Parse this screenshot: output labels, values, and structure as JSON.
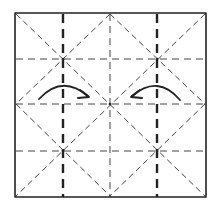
{
  "diagram": {
    "title": "Origami folding step: square base crease pattern with inward folds",
    "colors": {
      "ink": "#222222",
      "paper": "#ffffff",
      "line_light": "#444444"
    },
    "paper_square": {
      "x1": 15,
      "y1": 13,
      "x2": 206,
      "y2": 197
    },
    "valley_folds_thick": [
      {
        "x1": 63,
        "y1": 14,
        "x2": 63,
        "y2": 197
      },
      {
        "x1": 157,
        "y1": 14,
        "x2": 157,
        "y2": 197
      }
    ],
    "creases_vertical_thin": [
      {
        "x1": 110,
        "y1": 14,
        "x2": 110,
        "y2": 197
      }
    ],
    "creases_horizontal_thin": [
      {
        "x1": 16,
        "y1": 59,
        "x2": 205,
        "y2": 59
      },
      {
        "x1": 16,
        "y1": 104,
        "x2": 205,
        "y2": 104
      },
      {
        "x1": 16,
        "y1": 151,
        "x2": 205,
        "y2": 151
      }
    ],
    "creases_diagonal": [
      {
        "x1": 16,
        "y1": 14,
        "x2": 205,
        "y2": 196
      },
      {
        "x1": 205,
        "y1": 14,
        "x2": 16,
        "y2": 196
      },
      {
        "x1": 110,
        "y1": 14,
        "x2": 16,
        "y2": 104
      },
      {
        "x1": 110,
        "y1": 14,
        "x2": 205,
        "y2": 104
      },
      {
        "x1": 16,
        "y1": 104,
        "x2": 110,
        "y2": 196
      },
      {
        "x1": 205,
        "y1": 104,
        "x2": 110,
        "y2": 196
      }
    ],
    "arrows": [
      {
        "name": "left-fold-arrow",
        "direction": "right",
        "path": "M 39 99 Q 62 74 88 96",
        "head": "M 80 90 L 89 97 L 78 98"
      },
      {
        "name": "right-fold-arrow",
        "direction": "left",
        "path": "M 180 100 Q 158 74 132 96",
        "head": "M 140 90 L 131 97 L 142 98"
      }
    ],
    "intersections": [
      {
        "x": 63,
        "y": 59
      },
      {
        "x": 157,
        "y": 59
      },
      {
        "x": 110,
        "y": 104
      },
      {
        "x": 63,
        "y": 151
      },
      {
        "x": 157,
        "y": 151
      }
    ]
  }
}
